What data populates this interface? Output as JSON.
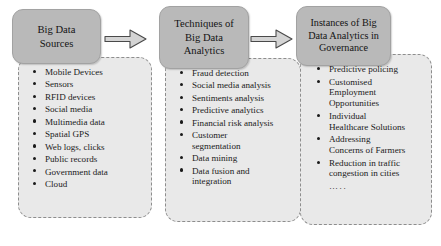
{
  "diagram": {
    "colors": {
      "header_box_fill": "#b9b9b9",
      "list_panel_fill": "#e9e9e9",
      "list_panel_border": "#8d8d8d",
      "arrow_fill": "#d4d4d4",
      "arrow_outline": "#4a4a4a",
      "text": "#1a1a1a",
      "background": "#ffffff"
    },
    "columns": [
      {
        "id": "big-data-sources",
        "header_lines": [
          "Big Data",
          "Sources"
        ],
        "items": [
          {
            "lines": [
              "Mobile Devices"
            ]
          },
          {
            "lines": [
              "Sensors"
            ]
          },
          {
            "lines": [
              "RFID devices"
            ]
          },
          {
            "lines": [
              "Social media"
            ]
          },
          {
            "lines": [
              "Multimedia data"
            ]
          },
          {
            "lines": [
              "Spatial GPS"
            ]
          },
          {
            "lines": [
              "Web logs, clicks"
            ]
          },
          {
            "lines": [
              "Public records"
            ]
          },
          {
            "lines": [
              "Government data"
            ]
          },
          {
            "lines": [
              "Cloud"
            ]
          }
        ],
        "trailing": ""
      },
      {
        "id": "techniques-of-big-data-analytics",
        "header_lines": [
          "Techniques of",
          "Big Data",
          "Analytics"
        ],
        "items": [
          {
            "lines": [
              "Fraud detection"
            ]
          },
          {
            "lines": [
              "Social media analysis"
            ]
          },
          {
            "lines": [
              "Sentiments analysis"
            ]
          },
          {
            "lines": [
              "Predictive analytics"
            ]
          },
          {
            "lines": [
              "Financial risk analysis"
            ]
          },
          {
            "lines": [
              "Customer",
              "segmentation"
            ]
          },
          {
            "lines": [
              "Data mining"
            ]
          },
          {
            "lines": [
              "Data fusion and",
              "integration"
            ]
          }
        ],
        "trailing": ""
      },
      {
        "id": "instances-of-big-data-analytics-in-governance",
        "header_lines": [
          "Instances of Big",
          "Data Analytics in",
          "Governance"
        ],
        "items": [
          {
            "lines": [
              "Predictive policing"
            ]
          },
          {
            "lines": [
              "Customised",
              "Employment",
              "Opportunities"
            ]
          },
          {
            "lines": [
              "Individual",
              "Healthcare Solutions"
            ]
          },
          {
            "lines": [
              "Addressing",
              "Concerns of Farmers"
            ]
          },
          {
            "lines": [
              "Reduction in traffic",
              "congestion in cities"
            ]
          }
        ],
        "trailing": "….."
      }
    ],
    "arrows": [
      {
        "id": "arrow-sources-to-techniques",
        "direction": "right"
      },
      {
        "id": "arrow-techniques-to-instances",
        "direction": "right"
      }
    ]
  }
}
